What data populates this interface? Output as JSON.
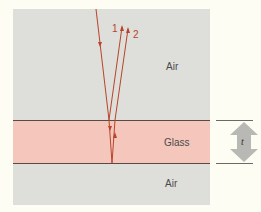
{
  "regions": {
    "air_top": "Air",
    "glass": "Glass",
    "air_bottom": "Air"
  },
  "rays": {
    "ray1_label": "1",
    "ray2_label": "2"
  },
  "thickness": {
    "label": "t"
  },
  "colors": {
    "air": "#dededa",
    "glass": "#f4c6bc",
    "ray": "#b8442a",
    "interface": "#5a4a44",
    "arrow": "#b8b8b4"
  }
}
